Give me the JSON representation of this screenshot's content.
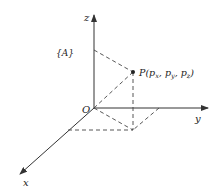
{
  "diagram": {
    "frame_label": "{A}",
    "origin_label": "O",
    "axes": {
      "x": "x",
      "y": "y",
      "z": "z"
    },
    "point": {
      "name": "P",
      "label": "P(p",
      "sub_x": "x",
      "sep1": ", p",
      "sub_y": "y",
      "sep2": ", p",
      "sub_z": "z",
      "close": ")"
    },
    "colors": {
      "line": "#333333",
      "background": "#ffffff"
    }
  }
}
